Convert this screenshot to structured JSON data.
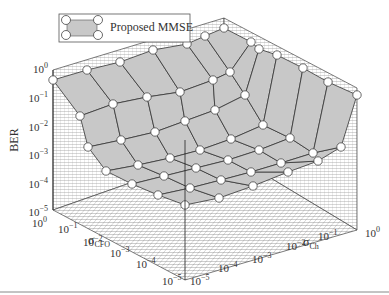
{
  "chart_data": {
    "type": "surface3d",
    "title": "",
    "legend": [
      {
        "label": "Proposed MMSE",
        "style": "gray surface with circle markers"
      }
    ],
    "zlabel": "BER",
    "xlabel": "σCFO",
    "ylabel": "σCh",
    "xlabel_main": "σ",
    "xlabel_sub": "CFO",
    "ylabel_main": "σ",
    "ylabel_sub": "Ch",
    "z_ticks": [
      "10^0",
      "10^-1",
      "10^-2",
      "10^-3",
      "10^-4",
      "10^-5"
    ],
    "x_ticks": [
      "10^0",
      "10^-1",
      "10^-2",
      "10^-3",
      "10^-4",
      "10^-5"
    ],
    "y_ticks": [
      "10^-5",
      "10^-4",
      "10^-3",
      "10^-2",
      "10^-1",
      "10^0"
    ],
    "zlim": [
      "10^-5",
      "10^0"
    ],
    "xlim": [
      "10^-5",
      "10^0"
    ],
    "ylim": [
      "10^-5",
      "10^0"
    ],
    "scale": "log-log-log",
    "grid": true,
    "surface_color": "#c8c8c8",
    "marker": "open-circle",
    "nodes_px": [
      [
        [
          53,
          80
        ],
        [
          87,
          70
        ],
        [
          120,
          62
        ],
        [
          153,
          50
        ],
        [
          187,
          44
        ],
        [
          205,
          36
        ],
        [
          224,
          28
        ]
      ],
      [
        [
          80,
          116
        ],
        [
          113,
          104
        ],
        [
          147,
          97
        ],
        [
          180,
          92
        ],
        [
          213,
          80
        ],
        [
          230,
          72
        ],
        [
          251,
          42
        ]
      ],
      [
        [
          88,
          147
        ],
        [
          121,
          140
        ],
        [
          155,
          132
        ],
        [
          185,
          121
        ],
        [
          215,
          110
        ],
        [
          245,
          95
        ],
        [
          259,
          49
        ]
      ],
      [
        [
          106,
          171
        ],
        [
          138,
          165
        ],
        [
          170,
          158
        ],
        [
          200,
          150
        ],
        [
          231,
          139
        ],
        [
          263,
          125
        ],
        [
          277,
          55
        ]
      ],
      [
        [
          132,
          184
        ],
        [
          164,
          176
        ],
        [
          196,
          168
        ],
        [
          228,
          160
        ],
        [
          259,
          150
        ],
        [
          290,
          138
        ],
        [
          303,
          68
        ]
      ],
      [
        [
          158,
          195
        ],
        [
          190,
          188
        ],
        [
          221,
          180
        ],
        [
          251,
          172
        ],
        [
          281,
          163
        ],
        [
          313,
          153
        ],
        [
          328,
          82
        ]
      ],
      [
        [
          185,
          205
        ],
        [
          219,
          198
        ],
        [
          253,
          186
        ],
        [
          288,
          172
        ],
        [
          318,
          161
        ],
        [
          341,
          147
        ],
        [
          357,
          95
        ]
      ]
    ]
  },
  "legend": {
    "label": "Proposed MMSE"
  },
  "axes": {
    "z_label": "BER",
    "z_ticks": [
      {
        "base": "10",
        "exp": "0"
      },
      {
        "base": "10",
        "exp": "−1"
      },
      {
        "base": "10",
        "exp": "−2"
      },
      {
        "base": "10",
        "exp": "−3"
      },
      {
        "base": "10",
        "exp": "−4"
      },
      {
        "base": "10",
        "exp": "−5"
      }
    ],
    "x_ticks": [
      {
        "base": "10",
        "exp": "0"
      },
      {
        "base": "10",
        "exp": "−1"
      },
      {
        "base": "10",
        "exp": "−2"
      },
      {
        "base": "10",
        "exp": "−3"
      },
      {
        "base": "10",
        "exp": "−4"
      },
      {
        "base": "10",
        "exp": "−5"
      }
    ],
    "y_ticks": [
      {
        "base": "10",
        "exp": "−5"
      },
      {
        "base": "10",
        "exp": "−4"
      },
      {
        "base": "10",
        "exp": "−3"
      },
      {
        "base": "10",
        "exp": "−2"
      },
      {
        "base": "10",
        "exp": "−1"
      },
      {
        "base": "10",
        "exp": "0"
      }
    ],
    "x_label_main": "σ",
    "x_label_sub": "CFO",
    "y_label_main": "σ",
    "y_label_sub": "Ch"
  }
}
